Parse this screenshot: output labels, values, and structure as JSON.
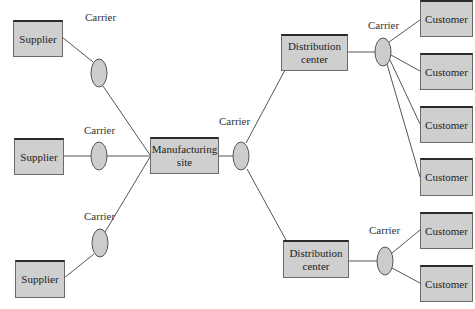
{
  "diagram": {
    "type": "supply-chain-network",
    "colors": {
      "node_fill": "#cfcfcf",
      "node_border": "#2a2a2a",
      "line": "#555555",
      "carrier_fill": "#cccccc"
    },
    "suppliers": [
      {
        "label": "Supplier"
      },
      {
        "label": "Supplier"
      },
      {
        "label": "Supplier"
      }
    ],
    "manufacturing": {
      "label": "Manufacturing site"
    },
    "distribution_centers": [
      {
        "label": "Distribution center"
      },
      {
        "label": "Distribution center"
      }
    ],
    "customers": [
      {
        "label": "Customer"
      },
      {
        "label": "Customer"
      },
      {
        "label": "Customer"
      },
      {
        "label": "Customer"
      },
      {
        "label": "Customer"
      },
      {
        "label": "Customer"
      }
    ],
    "carriers": [
      {
        "label": "Carrier"
      },
      {
        "label": "Carrier"
      },
      {
        "label": "Carrier"
      },
      {
        "label": "Carrier"
      },
      {
        "label": "Carrier"
      },
      {
        "label": "Carrier"
      }
    ],
    "edges": [
      [
        "Supplier 1",
        "Carrier 1",
        "Manufacturing site"
      ],
      [
        "Supplier 2",
        "Carrier 2",
        "Manufacturing site"
      ],
      [
        "Supplier 3",
        "Carrier 3",
        "Manufacturing site"
      ],
      [
        "Manufacturing site",
        "Carrier 4",
        "Distribution center 1"
      ],
      [
        "Manufacturing site",
        "Carrier 4",
        "Distribution center 2"
      ],
      [
        "Distribution center 1",
        "Carrier 5",
        "Customer 1-4"
      ],
      [
        "Distribution center 2",
        "Carrier 6",
        "Customer 5-6"
      ]
    ]
  }
}
